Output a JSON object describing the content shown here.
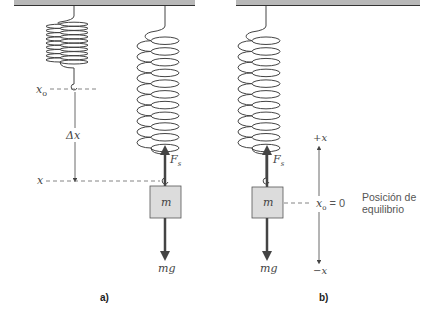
{
  "figure": {
    "panel_a": {
      "caption": "a)",
      "labels": {
        "x0": "x",
        "x0_sub": "o",
        "delta_x": "Δx",
        "x": "x",
        "mass": "m",
        "spring_force": "F",
        "spring_force_sub": "s",
        "weight": "mg"
      }
    },
    "panel_b": {
      "caption": "b)",
      "labels": {
        "plus_x": "+x",
        "minus_x": "−x",
        "x0_eq": "x",
        "x0_eq_sub": "o",
        "x0_eq_value": " = 0",
        "equilibrium_line1": "Posición de",
        "equilibrium_line2": "equilibrio",
        "mass": "m",
        "spring_force": "F",
        "spring_force_sub": "s",
        "weight": "mg"
      }
    },
    "colors": {
      "ceiling": "#b8b8b8",
      "ceiling_edge": "#333333",
      "mass_fill": "#dcdcdc",
      "line": "#444444"
    }
  }
}
